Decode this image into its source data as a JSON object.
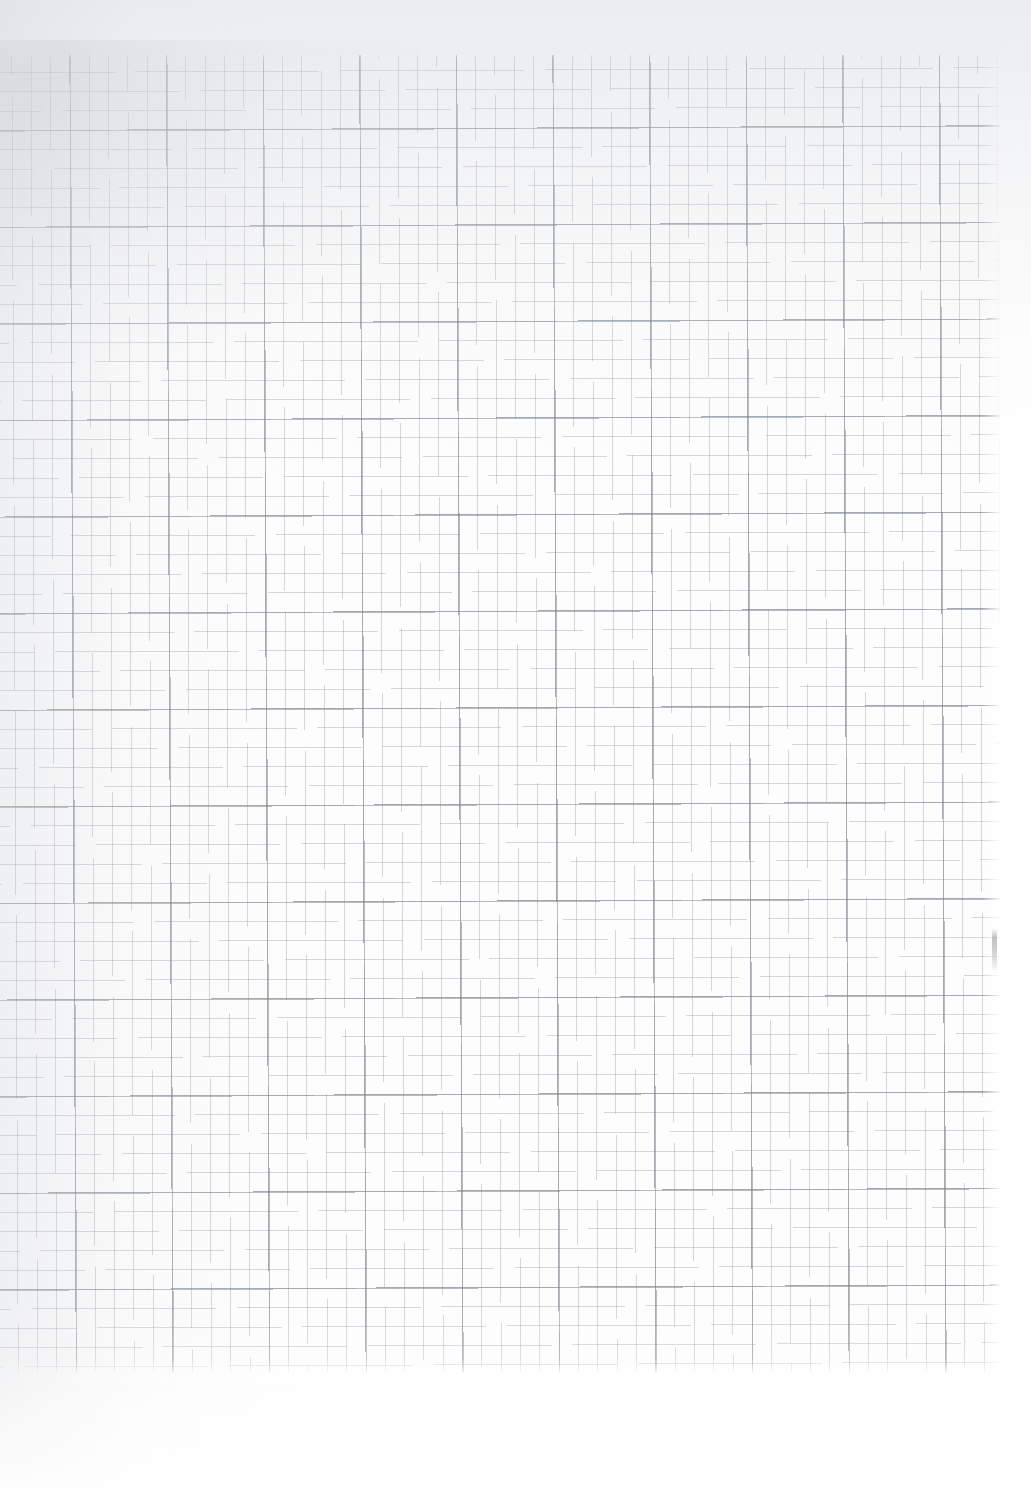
{
  "document": {
    "kind": "scanned-graph-paper",
    "title": "",
    "visible_text": "",
    "orientation": "portrait",
    "page_width_px": 1031,
    "page_height_px": 1487
  },
  "paper": {
    "background_color": "#fdfdfd",
    "margin_color": "#ffffff",
    "texture": "uncoated-paper-fibre"
  },
  "grid": {
    "region": {
      "left_px": 0,
      "top_px": 55,
      "right_px": 1000,
      "bottom_px": 1372,
      "width_px": 1000,
      "height_px": 1317
    },
    "minor": {
      "spacing_px": 19.32,
      "line_width_px": 0.9,
      "color": "#969ca6",
      "opacity": 0.4
    },
    "major": {
      "every_n_minor": 5,
      "spacing_px": 96.6,
      "line_width_px": 1.5,
      "color": "#78808c",
      "opacity": 0.52
    },
    "skew_degrees": -0.28,
    "major_vertical_positions_px": [
      0,
      97,
      194,
      291,
      388,
      485,
      581,
      678,
      775,
      872,
      969
    ],
    "major_horizontal_positions_px": [
      78,
      175,
      272,
      368,
      465,
      562,
      658,
      755,
      852,
      948,
      1045,
      1142,
      1238,
      1335
    ]
  },
  "scan_artifacts": {
    "top_shadow": {
      "color": "#ced1d6",
      "height_px": 470,
      "opacity": 0.4
    },
    "left_shadow": {
      "color": "#cdd0d5",
      "width_px": 300,
      "opacity": 0.3
    },
    "corner_vignette": {
      "color": "#c4c8ce",
      "position": "top-left",
      "opacity": 0.34
    },
    "blemish": {
      "label": "ink-smudge",
      "x_px": 992,
      "y_px": 928,
      "width_px": 5,
      "height_px": 44,
      "color": "#8e9196"
    }
  }
}
